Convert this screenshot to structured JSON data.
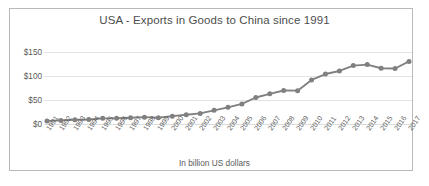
{
  "chart_data": {
    "type": "line",
    "title": "USA - Exports in Goods to China since 1991",
    "xlabel": "",
    "ylabel": "",
    "footnote": "In billion US dollars",
    "grid": true,
    "legend": "none",
    "marker": "circle",
    "series_color": "#808080",
    "grid_color": "#e3e3e3",
    "ylim": [
      0,
      150
    ],
    "yticks": [
      0,
      50,
      100,
      150
    ],
    "ytick_labels": [
      "$0",
      "$50",
      "$100",
      "$150"
    ],
    "categories": [
      "1991",
      "1992",
      "1993",
      "1994",
      "1995",
      "1996",
      "1997",
      "1998",
      "1999",
      "2000",
      "2001",
      "2002",
      "2003",
      "2004",
      "2005",
      "2006",
      "2007",
      "2008",
      "2009",
      "2010",
      "2011",
      "2012",
      "2013",
      "2014",
      "2015",
      "2016",
      "2017"
    ],
    "series": [
      {
        "name": "Exports in Goods to China",
        "values": [
          6.3,
          7.5,
          8.8,
          9.3,
          11.8,
          12.0,
          12.9,
          14.3,
          13.1,
          16.3,
          19.2,
          22.1,
          28.4,
          34.7,
          41.8,
          55.2,
          62.9,
          69.7,
          69.5,
          91.9,
          104.1,
          110.5,
          121.7,
          123.7,
          116.2,
          115.6,
          130.4
        ]
      }
    ]
  }
}
